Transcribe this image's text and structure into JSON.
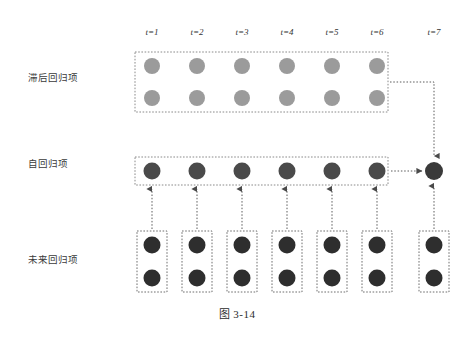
{
  "figure": {
    "caption": "图 3-14",
    "background_color": "#ffffff"
  },
  "columns": [
    {
      "id": "t1",
      "label": "t=1",
      "x": 152
    },
    {
      "id": "t2",
      "label": "t=2",
      "x": 197
    },
    {
      "id": "t3",
      "label": "t=3",
      "x": 242
    },
    {
      "id": "t4",
      "label": "t=4",
      "x": 287
    },
    {
      "id": "t5",
      "label": "t=5",
      "x": 332
    },
    {
      "id": "t6",
      "label": "t=6",
      "x": 377
    },
    {
      "id": "t7",
      "label": "t=7",
      "x": 434
    }
  ],
  "header_y": 33,
  "rows": [
    {
      "id": "lagged",
      "label": "滞后回归项",
      "label_x": 28,
      "label_y": 77,
      "node_color": "#9b9b9b",
      "node_radius": 8,
      "circle_rows_y": [
        66,
        98
      ],
      "group_box": {
        "x": 135,
        "y": 52,
        "width": 253,
        "height": 60
      },
      "columns": [
        "t1",
        "t2",
        "t3",
        "t4",
        "t5",
        "t6"
      ],
      "circles_per_column": 2
    },
    {
      "id": "autoregressive",
      "label": "自回归项",
      "label_x": 28,
      "label_y": 163,
      "node_color": "#4a4a4a",
      "node_radius": 8.5,
      "circle_rows_y": [
        171
      ],
      "group_box": {
        "x": 135,
        "y": 157,
        "width": 253,
        "height": 28
      },
      "columns": [
        "t1",
        "t2",
        "t3",
        "t4",
        "t5",
        "t6"
      ],
      "circles_per_column": 1
    },
    {
      "id": "future",
      "label": "未来回归项",
      "label_x": 28,
      "label_y": 259,
      "node_color": "#2e2e2e",
      "node_radius": 8.5,
      "circle_rows_y": [
        245,
        278
      ],
      "per_column_boxes": {
        "width": 30,
        "y": 231,
        "height": 61
      },
      "columns": [
        "t1",
        "t2",
        "t3",
        "t4",
        "t5",
        "t6",
        "t7"
      ],
      "circles_per_column": 2
    }
  ],
  "output_node": {
    "id": "t7-output",
    "column": "t7",
    "x": 434,
    "y": 171,
    "radius": 9,
    "color": "#3a3a3a"
  },
  "connectors": [
    {
      "id": "future-to-auto-t1",
      "type": "vertical-arrow-up",
      "from_x": 152,
      "from_y": 229,
      "to_y": 189
    },
    {
      "id": "future-to-auto-t2",
      "type": "vertical-arrow-up",
      "from_x": 197,
      "from_y": 229,
      "to_y": 189
    },
    {
      "id": "future-to-auto-t3",
      "type": "vertical-arrow-up",
      "from_x": 242,
      "from_y": 229,
      "to_y": 189
    },
    {
      "id": "future-to-auto-t4",
      "type": "vertical-arrow-up",
      "from_x": 287,
      "from_y": 229,
      "to_y": 189
    },
    {
      "id": "future-to-auto-t5",
      "type": "vertical-arrow-up",
      "from_x": 332,
      "from_y": 229,
      "to_y": 189
    },
    {
      "id": "future-to-auto-t6",
      "type": "vertical-arrow-up",
      "from_x": 377,
      "from_y": 229,
      "to_y": 189
    },
    {
      "id": "future-to-output-t7",
      "type": "vertical-arrow-up",
      "from_x": 434,
      "from_y": 229,
      "to_y": 186
    },
    {
      "id": "auto-to-output",
      "type": "horizontal-arrow-right",
      "from_x": 390,
      "to_x": 422,
      "y": 171
    },
    {
      "id": "lagged-to-output",
      "type": "elbow-right-down",
      "from_x": 390,
      "from_y": 82,
      "corner_x": 434,
      "to_y": 155
    }
  ],
  "style": {
    "box_border_color": "#8a8a8a",
    "connector_color": "#6b6b6b",
    "text_color": "#333333"
  }
}
